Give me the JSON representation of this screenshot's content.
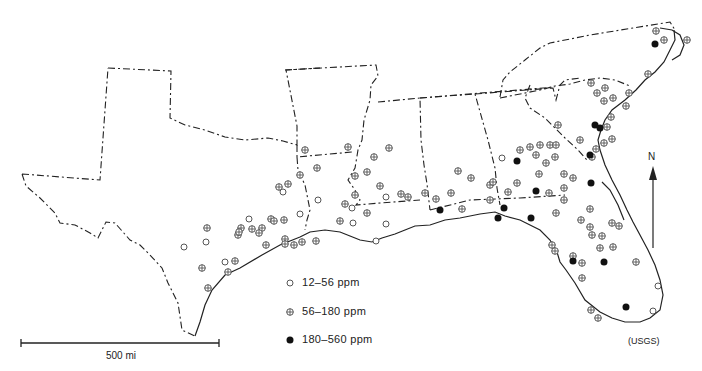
{
  "map": {
    "subject": "Concentration ranges at sampled sites, southeastern United States",
    "legend": [
      {
        "symbol": "open-circle",
        "label": "12–56  ppm"
      },
      {
        "symbol": "crossed-circle",
        "label": "56–180 ppm"
      },
      {
        "symbol": "filled-circle",
        "label": "180–560 ppm"
      }
    ],
    "scale_bar": {
      "label": "500 mi"
    },
    "north_arrow": {
      "label": "N"
    },
    "credit": "(USGS)",
    "points": {
      "low": [
        [
          283,
          192
        ],
        [
          352,
          208
        ],
        [
          353,
          223
        ],
        [
          300,
          214
        ],
        [
          318,
          200
        ],
        [
          386,
          197
        ],
        [
          386,
          224
        ],
        [
          376,
          241
        ],
        [
          249,
          219
        ],
        [
          206,
          242
        ],
        [
          225,
          262
        ],
        [
          184,
          247
        ],
        [
          658,
          286
        ],
        [
          653,
          311
        ],
        [
          502,
          158
        ]
      ],
      "mid": [
        [
          305,
          150
        ],
        [
          317,
          168
        ],
        [
          300,
          175
        ],
        [
          288,
          184
        ],
        [
          279,
          187
        ],
        [
          355,
          176
        ],
        [
          389,
          148
        ],
        [
          348,
          147
        ],
        [
          374,
          157
        ],
        [
          367,
          172
        ],
        [
          380,
          186
        ],
        [
          401,
          194
        ],
        [
          408,
          197
        ],
        [
          355,
          195
        ],
        [
          345,
          204
        ],
        [
          367,
          213
        ],
        [
          340,
          221
        ],
        [
          302,
          242
        ],
        [
          241,
          228
        ],
        [
          238,
          235
        ],
        [
          252,
          229
        ],
        [
          262,
          228
        ],
        [
          271,
          219
        ],
        [
          274,
          221
        ],
        [
          259,
          233
        ],
        [
          285,
          239
        ],
        [
          294,
          245
        ],
        [
          207,
          228
        ],
        [
          239,
          232
        ],
        [
          202,
          268
        ],
        [
          208,
          288
        ],
        [
          228,
          272
        ],
        [
          235,
          261
        ],
        [
          266,
          245
        ],
        [
          285,
          244
        ],
        [
          316,
          241
        ],
        [
          284,
          220
        ],
        [
          458,
          171
        ],
        [
          471,
          178
        ],
        [
          490,
          185
        ],
        [
          425,
          193
        ],
        [
          436,
          199
        ],
        [
          451,
          193
        ],
        [
          490,
          200
        ],
        [
          462,
          209
        ],
        [
          520,
          150
        ],
        [
          530,
          147
        ],
        [
          540,
          145
        ],
        [
          550,
          145
        ],
        [
          556,
          145
        ],
        [
          555,
          157
        ],
        [
          536,
          155
        ],
        [
          546,
          163
        ],
        [
          539,
          174
        ],
        [
          564,
          174
        ],
        [
          517,
          183
        ],
        [
          493,
          182
        ],
        [
          508,
          192
        ],
        [
          549,
          193
        ],
        [
          564,
          200
        ],
        [
          592,
          157
        ],
        [
          596,
          149
        ],
        [
          604,
          143
        ],
        [
          612,
          139
        ],
        [
          580,
          140
        ],
        [
          607,
          127
        ],
        [
          611,
          117
        ],
        [
          604,
          101
        ],
        [
          613,
          98
        ],
        [
          591,
          83
        ],
        [
          597,
          93
        ],
        [
          605,
          88
        ],
        [
          656,
          31
        ],
        [
          664,
          40
        ],
        [
          687,
          40
        ],
        [
          648,
          74
        ],
        [
          629,
          93
        ],
        [
          626,
          106
        ],
        [
          558,
          125
        ],
        [
          573,
          178
        ],
        [
          564,
          188
        ],
        [
          590,
          209
        ],
        [
          581,
          220
        ],
        [
          590,
          227
        ],
        [
          592,
          235
        ],
        [
          602,
          236
        ],
        [
          619,
          226
        ],
        [
          600,
          248
        ],
        [
          612,
          223
        ],
        [
          556,
          213
        ],
        [
          555,
          251
        ],
        [
          552,
          245
        ],
        [
          573,
          256
        ],
        [
          582,
          263
        ],
        [
          582,
          278
        ],
        [
          613,
          247
        ],
        [
          636,
          262
        ],
        [
          591,
          310
        ],
        [
          598,
          318
        ]
      ],
      "high": [
        [
          655,
          44
        ],
        [
          600,
          128
        ],
        [
          595,
          125
        ],
        [
          590,
          155
        ],
        [
          591,
          183
        ],
        [
          517,
          161
        ],
        [
          504,
          208
        ],
        [
          536,
          191
        ],
        [
          498,
          218
        ],
        [
          531,
          218
        ],
        [
          573,
          261
        ],
        [
          604,
          262
        ],
        [
          626,
          307
        ],
        [
          440,
          210
        ]
      ]
    }
  }
}
